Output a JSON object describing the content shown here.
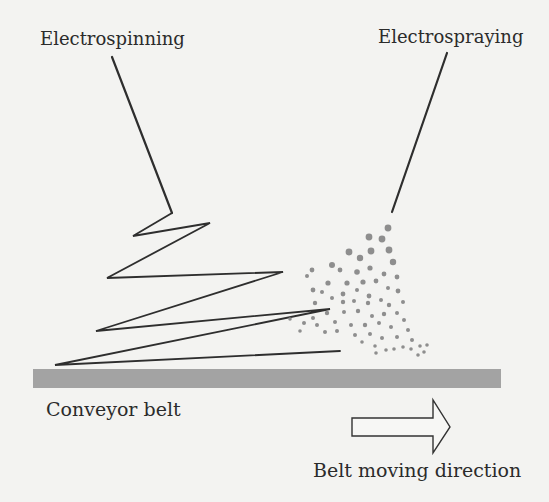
{
  "diagram": {
    "labels": {
      "electrospinning": "Electrospinning",
      "electrospraying": "Electrospraying",
      "conveyor_belt": "Conveyor belt",
      "belt_direction": "Belt moving direction"
    },
    "colors": {
      "background": "#f3f3f1",
      "text": "#2b2b2b",
      "fiber_line": "#2e2e2e",
      "belt": "#a3a3a3",
      "droplet": "#8e8e8e",
      "arrow_stroke": "#333333",
      "arrow_fill": "#f7f7f5"
    },
    "electrospinning_needle": {
      "x1": 112,
      "y1": 57,
      "x2": 172,
      "y2": 213
    },
    "electrospraying_needle": {
      "x1": 447,
      "y1": 53,
      "x2": 392,
      "y2": 212
    },
    "fiber_path": [
      [
        172,
        213
      ],
      [
        133,
        236
      ],
      [
        210,
        223
      ],
      [
        107,
        278
      ],
      [
        283,
        272
      ],
      [
        96,
        331
      ],
      [
        330,
        309
      ],
      [
        55,
        365
      ],
      [
        340,
        351
      ]
    ],
    "belt": {
      "x": 33,
      "y": 369,
      "width": 468,
      "height": 19
    },
    "arrow": {
      "points": [
        [
          352,
          418
        ],
        [
          433,
          418
        ],
        [
          433,
          400
        ],
        [
          450,
          427
        ],
        [
          433,
          453
        ],
        [
          433,
          436
        ],
        [
          352,
          436
        ]
      ]
    }
  }
}
